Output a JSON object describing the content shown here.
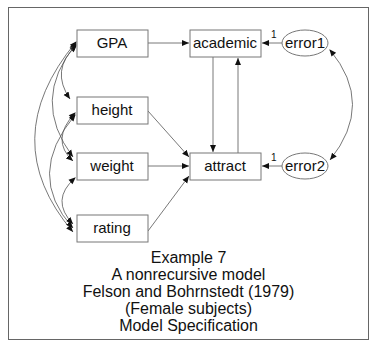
{
  "diagram": {
    "type": "path-model",
    "nodes": {
      "gpa": "GPA",
      "height": "height",
      "weight": "weight",
      "rating": "rating",
      "academic": "academic",
      "attract": "attract",
      "error1": "error1",
      "error2": "error2"
    },
    "weights": {
      "error1_academic": "1",
      "error2_attract": "1"
    },
    "edges": [
      {
        "from": "GPA",
        "to": "academic",
        "type": "directed"
      },
      {
        "from": "height",
        "to": "attract",
        "type": "directed"
      },
      {
        "from": "weight",
        "to": "attract",
        "type": "directed"
      },
      {
        "from": "rating",
        "to": "attract",
        "type": "directed"
      },
      {
        "from": "academic",
        "to": "attract",
        "type": "directed"
      },
      {
        "from": "attract",
        "to": "academic",
        "type": "directed"
      },
      {
        "from": "error1",
        "to": "academic",
        "type": "directed",
        "label": "1"
      },
      {
        "from": "error2",
        "to": "attract",
        "type": "directed",
        "label": "1"
      },
      {
        "from": "error1",
        "to": "error2",
        "type": "covariance"
      },
      {
        "from": "GPA",
        "to": "height",
        "type": "covariance"
      },
      {
        "from": "GPA",
        "to": "weight",
        "type": "covariance"
      },
      {
        "from": "GPA",
        "to": "rating",
        "type": "covariance"
      },
      {
        "from": "height",
        "to": "weight",
        "type": "covariance"
      },
      {
        "from": "height",
        "to": "rating",
        "type": "covariance"
      },
      {
        "from": "weight",
        "to": "rating",
        "type": "covariance"
      }
    ]
  },
  "caption": {
    "line1": "Example 7",
    "line2": "A nonrecursive model",
    "line3": "Felson and Bohrnstedt (1979)",
    "line4": "(Female subjects)",
    "line5": "Model Specification"
  }
}
